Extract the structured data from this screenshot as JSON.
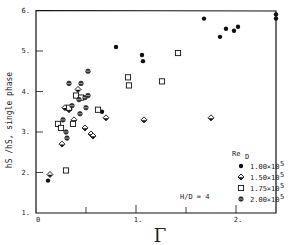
{
  "chart_data": {
    "type": "scatter",
    "title": "",
    "xlabel": "Γ",
    "ylabel": "hS /hS, single phase",
    "xlim": [
      0,
      2.4
    ],
    "ylim": [
      1,
      6
    ],
    "x_ticks": [
      "0",
      "",
      "1.",
      "",
      "2."
    ],
    "x_tick_values": [
      0,
      0.5,
      1,
      1.5,
      2
    ],
    "y_ticks": [
      "1.",
      "2.",
      "3.",
      "4.",
      "5.",
      "6."
    ],
    "y_tick_values": [
      1,
      2,
      3,
      4,
      5,
      6
    ],
    "grid": false,
    "annotation": "H/D = 4",
    "legend_title": "ReD",
    "legend_position": "lower right",
    "series": [
      {
        "name": "1.00×10⁵",
        "marker": "filled-circle",
        "points": [
          [
            0.12,
            1.8
          ],
          [
            0.66,
            3.5
          ],
          [
            0.8,
            5.1
          ],
          [
            1.06,
            4.9
          ],
          [
            1.07,
            4.75
          ],
          [
            1.68,
            5.8
          ],
          [
            1.84,
            5.35
          ],
          [
            1.9,
            5.55
          ],
          [
            1.98,
            5.5
          ],
          [
            2.02,
            5.6
          ],
          [
            2.4,
            5.9
          ],
          [
            2.4,
            5.8
          ]
        ]
      },
      {
        "name": "1.50×10⁵",
        "marker": "diamond",
        "points": [
          [
            0.14,
            1.95
          ],
          [
            0.26,
            2.7
          ],
          [
            0.29,
            3.6
          ],
          [
            0.33,
            3.55
          ],
          [
            0.38,
            3.3
          ],
          [
            0.42,
            4.05
          ],
          [
            0.49,
            3.1
          ],
          [
            0.55,
            2.95
          ],
          [
            0.57,
            2.9
          ],
          [
            0.7,
            3.35
          ],
          [
            1.08,
            3.3
          ],
          [
            1.75,
            3.35
          ]
        ]
      },
      {
        "name": "1.75×10⁵",
        "marker": "open-square",
        "points": [
          [
            0.22,
            3.2
          ],
          [
            0.25,
            3.1
          ],
          [
            0.3,
            2.05
          ],
          [
            0.33,
            3.6
          ],
          [
            0.37,
            3.2
          ],
          [
            0.4,
            3.9
          ],
          [
            0.45,
            3.85
          ],
          [
            0.62,
            3.55
          ],
          [
            0.92,
            4.35
          ],
          [
            0.93,
            4.15
          ],
          [
            1.26,
            4.25
          ],
          [
            1.42,
            4.95
          ]
        ]
      },
      {
        "name": "2.00×10⁵",
        "marker": "crossed-circle",
        "points": [
          [
            0.27,
            3.3
          ],
          [
            0.3,
            3.0
          ],
          [
            0.31,
            2.85
          ],
          [
            0.33,
            4.2
          ],
          [
            0.36,
            3.65
          ],
          [
            0.43,
            3.8
          ],
          [
            0.45,
            4.2
          ],
          [
            0.49,
            3.85
          ],
          [
            0.52,
            3.9
          ],
          [
            0.52,
            4.5
          ],
          [
            0.5,
            3.6
          ],
          [
            0.44,
            3.45
          ]
        ]
      }
    ]
  },
  "legend": {
    "title": "Re",
    "title_sub": "D",
    "items": [
      {
        "label": "1.00×10",
        "exp": "5",
        "marker": "filled-circle"
      },
      {
        "label": "1.50×10",
        "exp": "5",
        "marker": "diamond"
      },
      {
        "label": "1.75×10",
        "exp": "5",
        "marker": "open-square"
      },
      {
        "label": "2.00×10",
        "exp": "5",
        "marker": "crossed-circle"
      }
    ]
  },
  "annotation": "H/D = 4",
  "axes": {
    "xlabel": "Γ",
    "ylabel": "hS /hS, single phase"
  }
}
